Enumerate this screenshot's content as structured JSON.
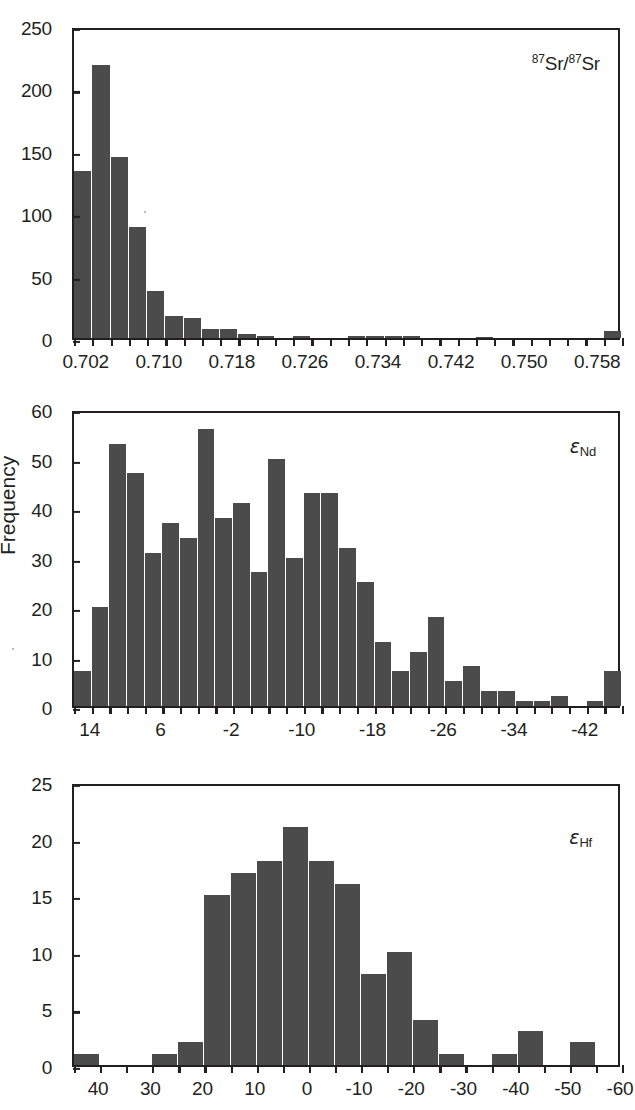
{
  "figure": {
    "y_axis_title": "Frequency",
    "background": "#ffffff",
    "bar_color": "#4b4b4b",
    "axis_color": "#231f20"
  },
  "panels": [
    {
      "id": "sr",
      "tag_prefix": "87",
      "tag_mid": "Sr/",
      "tag_prefix2": "87",
      "tag_suffix": "Sr",
      "y_ticks": [
        "0",
        "50",
        "100",
        "150",
        "200",
        "250"
      ],
      "x_ticks": [
        "0.702",
        "0.710",
        "0.718",
        "0.726",
        "0.734",
        "0.742",
        "0.750",
        "0.758"
      ]
    },
    {
      "id": "nd",
      "tag_eps": "ε",
      "tag_sub": "Nd",
      "y_ticks": [
        "0",
        "10",
        "20",
        "30",
        "40",
        "50",
        "60"
      ],
      "x_ticks": [
        "14",
        "6",
        "-2",
        "-10",
        "-18",
        "-26",
        "-34",
        "-42"
      ]
    },
    {
      "id": "hf",
      "tag_eps": "ε",
      "tag_sub": "Hf",
      "y_ticks": [
        "0",
        "5",
        "10",
        "15",
        "20",
        "25"
      ],
      "x_ticks": [
        "40",
        "30",
        "20",
        "10",
        "0",
        "-10",
        "-20",
        "-30",
        "-40",
        "-50",
        "-60"
      ]
    }
  ],
  "chart_data": [
    {
      "type": "bar",
      "id": "sr-histogram",
      "title": "87Sr/87Sr",
      "xlabel": "87Sr/87Sr",
      "ylabel": "Frequency",
      "xlim": [
        0.7005,
        0.7605
      ],
      "ylim": [
        0,
        250
      ],
      "ytick_values": [
        0,
        50,
        100,
        150,
        200,
        250
      ],
      "xtick_values": [
        0.702,
        0.71,
        0.718,
        0.726,
        0.734,
        0.742,
        0.75,
        0.758
      ],
      "bin_width": 0.002,
      "bin_starts": [
        0.7005,
        0.7025,
        0.7045,
        0.7065,
        0.7085,
        0.7105,
        0.7125,
        0.7145,
        0.7165,
        0.7185,
        0.7205,
        0.7225,
        0.7245,
        0.7265,
        0.7285,
        0.7305,
        0.7325,
        0.7345,
        0.7365,
        0.7385,
        0.7405,
        0.7425,
        0.7445,
        0.7465,
        0.7485,
        0.7505,
        0.7525,
        0.7545,
        0.7565,
        0.7585
      ],
      "values": [
        134,
        219,
        145,
        89,
        38,
        18,
        16,
        7,
        7,
        3,
        2,
        0,
        2,
        0,
        0,
        2,
        2,
        2,
        2,
        0,
        0,
        0,
        1,
        0,
        0,
        0,
        0,
        0,
        0,
        6
      ],
      "grid": false,
      "legend": null
    },
    {
      "type": "bar",
      "id": "epsilon-nd-histogram",
      "title": "εNd",
      "xlabel": "εNd",
      "ylabel": "Frequency",
      "xlim": [
        16,
        -46
      ],
      "ylim": [
        0,
        60
      ],
      "ytick_values": [
        0,
        10,
        20,
        30,
        40,
        50,
        60
      ],
      "xtick_values": [
        14,
        6,
        -2,
        -10,
        -18,
        -26,
        -34,
        -42
      ],
      "bin_width": 2,
      "bin_starts": [
        16,
        14,
        12,
        10,
        8,
        6,
        4,
        2,
        0,
        -2,
        -4,
        -6,
        -8,
        -10,
        -12,
        -14,
        -16,
        -18,
        -20,
        -22,
        -24,
        -26,
        -28,
        -30,
        -32,
        -34,
        -36,
        -38,
        -40,
        -42,
        -44
      ],
      "values": [
        7,
        20,
        53,
        47,
        31,
        37,
        34,
        56,
        38,
        41,
        27,
        50,
        30,
        43,
        43,
        32,
        25,
        13,
        7,
        11,
        18,
        5,
        8,
        3,
        3,
        1,
        1,
        2,
        0,
        1,
        7
      ],
      "grid": false,
      "legend": null
    },
    {
      "type": "bar",
      "id": "epsilon-hf-histogram",
      "title": "εHf",
      "xlabel": "εHf",
      "ylabel": "Frequency",
      "xlim": [
        45,
        -60
      ],
      "ylim": [
        0,
        25
      ],
      "ytick_values": [
        0,
        5,
        10,
        15,
        20,
        25
      ],
      "xtick_values": [
        40,
        30,
        20,
        10,
        0,
        -10,
        -20,
        -30,
        -40,
        -50,
        -60
      ],
      "bin_width": 5,
      "bin_starts": [
        45,
        40,
        35,
        30,
        25,
        20,
        15,
        10,
        5,
        0,
        -5,
        -10,
        -15,
        -20,
        -25,
        -30,
        -35,
        -40,
        -45,
        -50,
        -55
      ],
      "values": [
        1,
        0,
        0,
        1,
        2,
        15,
        17,
        18,
        21,
        18,
        16,
        8,
        10,
        4,
        1,
        0,
        1,
        3,
        0,
        2,
        0
      ],
      "grid": false,
      "legend": null
    }
  ]
}
